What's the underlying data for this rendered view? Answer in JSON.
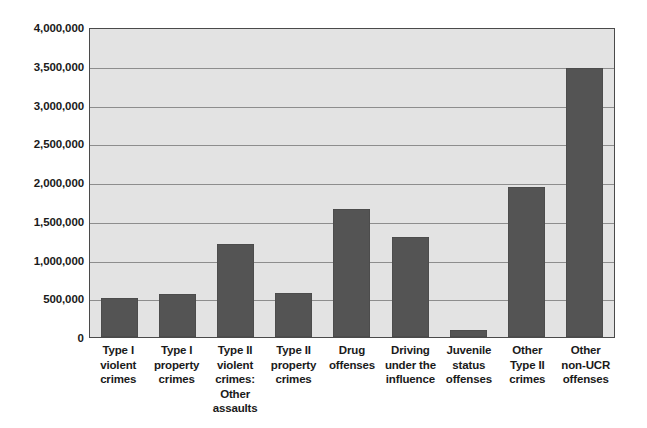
{
  "chart_data": {
    "type": "bar",
    "title": "",
    "xlabel": "",
    "ylabel": "",
    "ylim": [
      0,
      4000000
    ],
    "ytick_values": [
      0,
      500000,
      1000000,
      1500000,
      2000000,
      2500000,
      3000000,
      3500000,
      4000000
    ],
    "ytick_labels": [
      "0",
      "500,000",
      "1,000,000",
      "1,500,000",
      "2,000,000",
      "2,500,000",
      "3,000,000",
      "3,500,000",
      "4,000,000"
    ],
    "grid": true,
    "legend": false,
    "categories": [
      "Type I\nviolent\ncrimes",
      "Type I\nproperty\ncrimes",
      "Type II\nviolent\ncrimes:\nOther\nassaults",
      "Type II\nproperty\ncrimes",
      "Drug\noffenses",
      "Driving\nunder the\ninfluence",
      "Juvenile\nstatus\noffenses",
      "Other\nType II\ncrimes",
      "Other\nnon-UCR\noffenses"
    ],
    "values": [
      500000,
      560000,
      1200000,
      570000,
      1650000,
      1290000,
      90000,
      1940000,
      3470000
    ],
    "bar_color": "#545454",
    "plot_background_color": "#e3e3e3",
    "gridline_color": "#8d8d8d",
    "frame_color": "#4a4a4a"
  }
}
